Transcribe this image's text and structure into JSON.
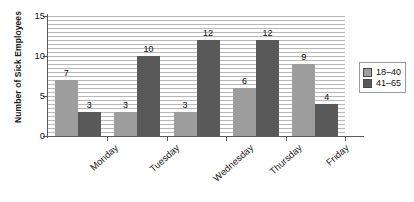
{
  "chart_data": {
    "type": "bar",
    "title": "",
    "xlabel": "",
    "ylabel": "Number of Sick Employees",
    "categories": [
      "Monday",
      "Tuesday",
      "Wednesday",
      "Thursday",
      "Friday"
    ],
    "series": [
      {
        "name": "18–40",
        "color": "#9d9d9d",
        "values": [
          7,
          3,
          3,
          6,
          9
        ]
      },
      {
        "name": "41–65",
        "color": "#595959",
        "values": [
          3,
          10,
          12,
          12,
          4
        ]
      }
    ],
    "ylim": [
      0,
      15
    ],
    "yticks": [
      0,
      5,
      10,
      15
    ],
    "ytick_labels": [
      "0",
      "5",
      "10",
      "15"
    ],
    "grid": true,
    "grid_interval": 0.5,
    "legend_position": "right",
    "data_labels": [
      [
        "7",
        "3",
        "3",
        "6",
        "9"
      ],
      [
        "3",
        "10",
        "12",
        "12",
        "4"
      ]
    ]
  },
  "legend": {
    "entries": [
      {
        "label": "18–40"
      },
      {
        "label": "41–65"
      }
    ]
  }
}
